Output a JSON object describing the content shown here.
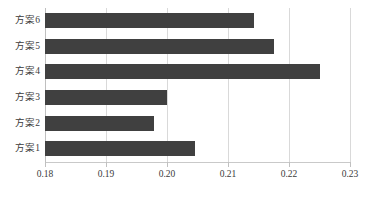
{
  "chart_data": {
    "type": "bar",
    "orientation": "horizontal",
    "title": "",
    "subtitle": "",
    "xlabel": "",
    "ylabel": "",
    "categories": [
      "方案1",
      "方案2",
      "方案3",
      "方案4",
      "方案5",
      "方案6"
    ],
    "values": [
      0.2046,
      0.1978,
      0.2,
      0.225,
      0.2175,
      0.2142
    ],
    "xlim": [
      0.18,
      0.23
    ],
    "xticks": [
      0.18,
      0.19,
      0.2,
      0.21,
      0.22,
      0.23
    ],
    "xtick_labels": [
      "0.18",
      "0.19",
      "0.20",
      "0.21",
      "0.22",
      "0.23"
    ],
    "grid": "vertical",
    "legend": "none",
    "bar_color": "#404040",
    "gridline_color": "#d9d9d9",
    "axis_color": "#bfbfbf",
    "background": "#ffffff",
    "category_order_top_to_bottom": [
      "方案6",
      "方案5",
      "方案4",
      "方案3",
      "方案2",
      "方案1"
    ],
    "bars_top_to_bottom": [
      {
        "label": "方案6",
        "value": 0.2142
      },
      {
        "label": "方案5",
        "value": 0.2175
      },
      {
        "label": "方案4",
        "value": 0.225
      },
      {
        "label": "方案3",
        "value": 0.2
      },
      {
        "label": "方案2",
        "value": 0.1978
      },
      {
        "label": "方案1",
        "value": 0.2046
      }
    ]
  }
}
